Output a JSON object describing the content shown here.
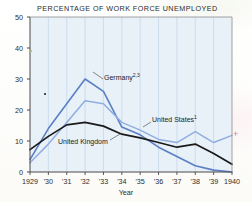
{
  "figure": {
    "title": "PERCENTAGE OF WORK FORCE UNEMPLOYED",
    "xaxis_title": "Year",
    "background_color": "#e8f0f8",
    "axis_color": "#4a4a4a",
    "gridline_color": "#b9cfe4"
  },
  "series_labels": {
    "germany": "Germany",
    "germany_footnote": "2,3",
    "united_states": "United States",
    "united_states_footnote": "1",
    "united_kingdom": "United Kingdom"
  },
  "artifacts": {
    "pink_mark": "+"
  },
  "chart_data": {
    "type": "line",
    "title": "PERCENTAGE OF WORK FORCE UNEMPLOYED",
    "xlabel": "Year",
    "ylabel": "",
    "xlim": [
      1929,
      1940
    ],
    "ylim": [
      0,
      50
    ],
    "grid": "vertical-only",
    "legend": "inline-annotations",
    "x": [
      1929,
      1930,
      1931,
      1932,
      1933,
      1934,
      1935,
      1936,
      1937,
      1938,
      1939,
      1940
    ],
    "xtick_labels": [
      "1929",
      "'30",
      "'31",
      "'32",
      "'33",
      "'34",
      "'35",
      "'36",
      "'37",
      "'38",
      "'39",
      "1940"
    ],
    "ytick_labels": [
      "0",
      "10",
      "20",
      "30",
      "40",
      "50"
    ],
    "yticks": [
      0,
      10,
      20,
      30,
      40,
      50
    ],
    "series": [
      {
        "name": "Germany",
        "footnote": "2,3",
        "color": "#5b7fc4",
        "width": 1.6,
        "values": [
          4,
          14,
          22,
          30,
          26,
          14.5,
          12,
          8,
          5,
          2,
          0.6,
          0
        ]
      },
      {
        "name": "United States",
        "footnote": "1",
        "color": "#90aee0",
        "width": 1.5,
        "values": [
          3,
          9,
          16,
          23,
          22,
          16,
          13.5,
          10.5,
          9.5,
          13,
          9.5,
          11.8
        ]
      },
      {
        "name": "United Kingdom",
        "footnote": "",
        "color": "#1a1a1a",
        "width": 1.7,
        "values": [
          7.2,
          11.5,
          15.2,
          16,
          14.8,
          12.2,
          11,
          9.5,
          8,
          9,
          6,
          2.5
        ]
      }
    ]
  }
}
